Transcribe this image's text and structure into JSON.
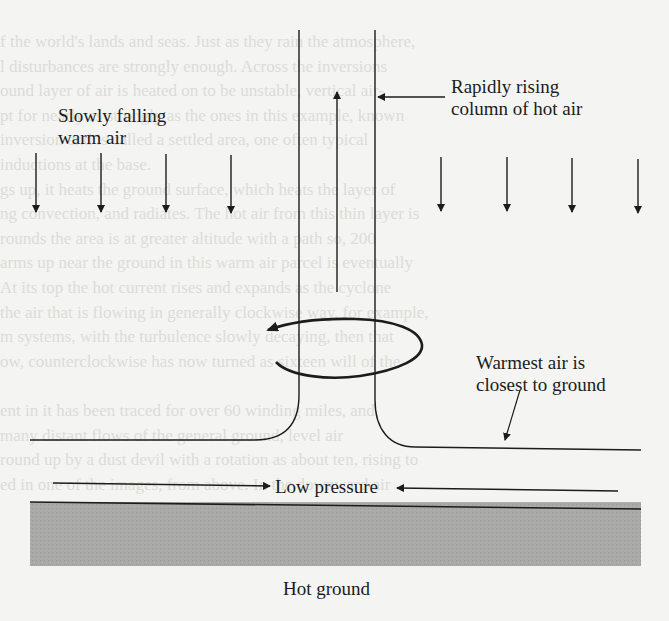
{
  "diagram": {
    "type": "convection-dust-devil-schematic",
    "labels": {
      "slowly_falling": [
        "Slowly falling",
        "warm air"
      ],
      "rising_column": [
        "Rapidly rising",
        "column of hot air"
      ],
      "warmest_air": [
        "Warmest air is",
        "closest to ground"
      ],
      "low_pressure": "Low pressure",
      "hot_ground": "Hot ground"
    },
    "colors": {
      "ink": "#1c1c1c",
      "paper": "#f4f4f2",
      "ground_fill": "#a9a9a7",
      "bleed_text": "#dcdcd8"
    },
    "elements": {
      "downward_arrows_left_x": [
        36,
        101,
        166,
        231
      ],
      "downward_arrows_right_x": [
        441,
        507,
        572,
        638
      ],
      "column_walls_x": [
        299,
        375
      ],
      "rotation_direction": "counterclockwise-arrowhead-left"
    }
  },
  "bleed_through_text": [
    "f the world's lands and seas. Just as they rain the atmosphere,",
    "l disturbances are strongly enough. Across the inversions",
    "ound layer of air is heated on to be unstable, vertical air-",
    "pt for nearly as strongly as the ones in this example, known",
    "inversion and is called a settled area, one often typical",
    "inductions at the base.",
    "gs up, it heats the ground surface, which heats the layer of",
    "ng convection, and radiates. The hot air from this thin layer is",
    "rounds the area is at greater altitude with a path so, 200",
    "arms up near the ground in this warm air parcel is eventually",
    "At its top the hot current rises and expands as the cyclone",
    "the air that is flowing in generally clockwise way, for example,",
    "m systems, with the turbulence slowly decaying, then that",
    "ow, counterclockwise has now turned as sixteen will of the",
    "",
    "ent in it has been traced for over 60 winding miles, and",
    "many distant flows of the general ground, level air",
    "round up by a dust devil with a rotation as about ten, rising to",
    "ed in one of the images, from above. In the downward air",
    ""
  ]
}
